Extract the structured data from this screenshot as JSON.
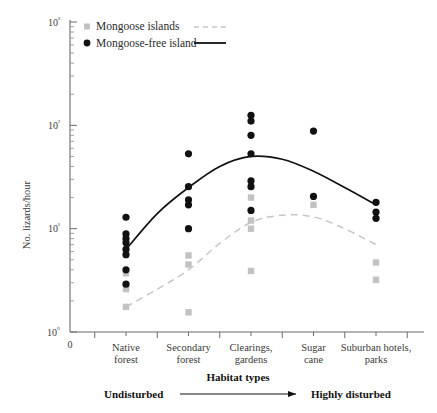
{
  "chart_data": {
    "type": "scatter",
    "title": "",
    "xlabel": "Habitat types",
    "ylabel": "No. lizards/hour",
    "yscale": "log",
    "ylim": [
      1,
      1000
    ],
    "ytick_labels": [
      "10⁰",
      "10¹",
      "10²",
      "10³"
    ],
    "ytick_values": [
      1,
      10,
      100,
      1000
    ],
    "xtick_origin_label": "0",
    "grid": false,
    "legend_position": "top-left",
    "categories": [
      "Native forest",
      "Secondary forest",
      "Clearings, gardens",
      "Sugar cane",
      "Suburban hotels, parks"
    ],
    "category_lines": [
      [
        "Native",
        "forest"
      ],
      [
        "Secondary",
        "forest"
      ],
      [
        "Clearings,",
        "gardens"
      ],
      [
        "Sugar",
        "cane"
      ],
      [
        "Suburban hotels,",
        "parks"
      ]
    ],
    "gradient": {
      "left_label": "Undisturbed",
      "right_label": "Highly disturbed",
      "axis_title": "Habitat types"
    },
    "series": [
      {
        "name": "Mongoose-free island",
        "marker": "circle",
        "color": "#111111",
        "line_style": "solid",
        "points": [
          {
            "category": "Native forest",
            "x": 1,
            "y": 12.9
          },
          {
            "category": "Native forest",
            "x": 1,
            "y": 8.9
          },
          {
            "category": "Native forest",
            "x": 1,
            "y": 8.0
          },
          {
            "category": "Native forest",
            "x": 1,
            "y": 7.3
          },
          {
            "category": "Native forest",
            "x": 1,
            "y": 6.3
          },
          {
            "category": "Native forest",
            "x": 1,
            "y": 5.6
          },
          {
            "category": "Native forest",
            "x": 1,
            "y": 4.0
          },
          {
            "category": "Native forest",
            "x": 1,
            "y": 2.9
          },
          {
            "category": "Secondary forest",
            "x": 2,
            "y": 53.0
          },
          {
            "category": "Secondary forest",
            "x": 2,
            "y": 25.5
          },
          {
            "category": "Secondary forest",
            "x": 2,
            "y": 19.0
          },
          {
            "category": "Secondary forest",
            "x": 2,
            "y": 17.0
          },
          {
            "category": "Secondary forest",
            "x": 2,
            "y": 10.0
          },
          {
            "category": "Clearings, gardens",
            "x": 3,
            "y": 125.0
          },
          {
            "category": "Clearings, gardens",
            "x": 3,
            "y": 110.0
          },
          {
            "category": "Clearings, gardens",
            "x": 3,
            "y": 80.0
          },
          {
            "category": "Clearings, gardens",
            "x": 3,
            "y": 53.0
          },
          {
            "category": "Clearings, gardens",
            "x": 3,
            "y": 29.0
          },
          {
            "category": "Clearings, gardens",
            "x": 3,
            "y": 25.5
          },
          {
            "category": "Clearings, gardens",
            "x": 3,
            "y": 15.0
          },
          {
            "category": "Sugar cane",
            "x": 4,
            "y": 88.0
          },
          {
            "category": "Sugar cane",
            "x": 4,
            "y": 20.5
          },
          {
            "category": "Suburban hotels, parks",
            "x": 5,
            "y": 18.0
          },
          {
            "category": "Suburban hotels, parks",
            "x": 5,
            "y": 14.5
          },
          {
            "category": "Suburban hotels, parks",
            "x": 5,
            "y": 12.6
          }
        ],
        "trend": [
          {
            "x": 1.0,
            "y": 6.3
          },
          {
            "x": 1.5,
            "y": 14.0
          },
          {
            "x": 2.0,
            "y": 25.0
          },
          {
            "x": 2.5,
            "y": 40.0
          },
          {
            "x": 3.0,
            "y": 50.0
          },
          {
            "x": 3.5,
            "y": 47.0
          },
          {
            "x": 4.0,
            "y": 36.0
          },
          {
            "x": 4.5,
            "y": 25.0
          },
          {
            "x": 5.0,
            "y": 17.0
          }
        ]
      },
      {
        "name": "Mongoose islands",
        "marker": "square",
        "color": "#c2c2c2",
        "line_style": "dashed",
        "points": [
          {
            "category": "Native forest",
            "x": 1,
            "y": 3.7
          },
          {
            "category": "Native forest",
            "x": 1,
            "y": 2.6
          },
          {
            "category": "Native forest",
            "x": 1,
            "y": 1.75
          },
          {
            "category": "Secondary forest",
            "x": 2,
            "y": 5.5
          },
          {
            "category": "Secondary forest",
            "x": 2,
            "y": 4.5
          },
          {
            "category": "Secondary forest",
            "x": 2,
            "y": 1.55
          },
          {
            "category": "Clearings, gardens",
            "x": 3,
            "y": 20.0
          },
          {
            "category": "Clearings, gardens",
            "x": 3,
            "y": 12.0
          },
          {
            "category": "Clearings, gardens",
            "x": 3,
            "y": 10.0
          },
          {
            "category": "Clearings, gardens",
            "x": 3,
            "y": 3.9
          },
          {
            "category": "Sugar cane",
            "x": 4,
            "y": 17.0
          },
          {
            "category": "Suburban hotels, parks",
            "x": 5,
            "y": 4.7
          },
          {
            "category": "Suburban hotels, parks",
            "x": 5,
            "y": 3.2
          }
        ],
        "trend": [
          {
            "x": 1.0,
            "y": 1.75
          },
          {
            "x": 1.5,
            "y": 2.6
          },
          {
            "x": 2.0,
            "y": 4.0
          },
          {
            "x": 2.5,
            "y": 7.2
          },
          {
            "x": 3.0,
            "y": 11.5
          },
          {
            "x": 3.5,
            "y": 13.5
          },
          {
            "x": 4.0,
            "y": 13.0
          },
          {
            "x": 4.5,
            "y": 10.0
          },
          {
            "x": 5.0,
            "y": 7.0
          }
        ]
      }
    ]
  },
  "legend": {
    "entries": [
      {
        "label": "Mongoose islands",
        "marker": "square",
        "line": "dashed"
      },
      {
        "label": "Mongoose-free island",
        "marker": "circle",
        "line": "solid"
      }
    ]
  },
  "colors": {
    "black": "#111111",
    "gray": "#c2c2c2",
    "axis": "#6b6b6b"
  }
}
